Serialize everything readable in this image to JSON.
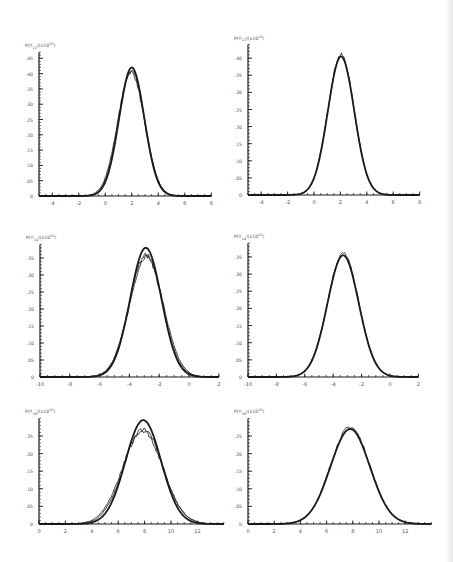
{
  "figure": {
    "layout": "3 rows x 2 columns",
    "line_color": "#1a1a1a",
    "text_color": "#555555"
  },
  "chart_data": [
    {
      "id": "p1",
      "type": "line",
      "position": "row1-left",
      "ylabel": "P(Y12)(x10)",
      "xticks": [
        -4,
        -2,
        0,
        2,
        4,
        6,
        8
      ],
      "yticks": [
        0,
        0.05,
        0.1,
        0.15,
        0.2,
        0.25,
        0.3,
        0.35,
        0.4,
        0.45
      ],
      "ytick_labels": [
        "0",
        ".05",
        ".10",
        ".15",
        ".20",
        ".25",
        ".30",
        ".35",
        ".40",
        ".45"
      ],
      "xlim": [
        -5,
        8
      ],
      "ylim": [
        0,
        0.47
      ],
      "series": [
        {
          "name": "theory",
          "style": "solid-thick",
          "mean": 2.0,
          "sigma": 0.95,
          "peak": 0.42
        },
        {
          "name": "simulation-a",
          "style": "noisy",
          "mean": 2.0,
          "sigma": 0.98,
          "peak": 0.41
        },
        {
          "name": "simulation-b",
          "style": "noisy",
          "mean": 1.95,
          "sigma": 1.0,
          "peak": 0.405
        }
      ]
    },
    {
      "id": "p2",
      "type": "line",
      "position": "row1-right",
      "ylabel": "P(Y12)(x10)",
      "xticks": [
        -4,
        -2,
        0,
        2,
        4,
        6,
        8
      ],
      "yticks": [
        0,
        0.05,
        0.1,
        0.15,
        0.2,
        0.25,
        0.3,
        0.35,
        0.4
      ],
      "ytick_labels": [
        "0",
        ".05",
        ".10",
        ".15",
        ".20",
        ".25",
        ".30",
        ".35",
        ".40"
      ],
      "xlim": [
        -5,
        8
      ],
      "ylim": [
        0,
        0.44
      ],
      "series": [
        {
          "name": "theory",
          "style": "solid-thick",
          "mean": 2.05,
          "sigma": 1.0,
          "peak": 0.405
        },
        {
          "name": "simulation",
          "style": "noisy",
          "mean": 2.05,
          "sigma": 1.0,
          "peak": 0.41
        }
      ]
    },
    {
      "id": "p3",
      "type": "line",
      "position": "row2-left",
      "ylabel": "P(Y14)(x10)",
      "xticks": [
        -10,
        -8,
        -6,
        -4,
        -2,
        0,
        2
      ],
      "yticks": [
        0,
        0.05,
        0.1,
        0.15,
        0.2,
        0.25,
        0.3,
        0.35
      ],
      "ytick_labels": [
        "0",
        ".05",
        ".10",
        ".15",
        ".20",
        ".25",
        ".30",
        ".35"
      ],
      "xlim": [
        -10,
        2
      ],
      "ylim": [
        0,
        0.39
      ],
      "series": [
        {
          "name": "theory",
          "style": "solid-thick",
          "mean": -2.9,
          "sigma": 1.05,
          "peak": 0.38
        },
        {
          "name": "simulation-a",
          "style": "noisy",
          "mean": -2.9,
          "sigma": 1.1,
          "peak": 0.36
        },
        {
          "name": "simulation-b",
          "style": "noisy",
          "mean": -2.85,
          "sigma": 1.12,
          "peak": 0.355
        }
      ]
    },
    {
      "id": "p4",
      "type": "line",
      "position": "row2-right",
      "ylabel": "P(Y14)(x10)",
      "xticks": [
        -10,
        -8,
        -6,
        -4,
        -2,
        0,
        2
      ],
      "yticks": [
        0,
        0.05,
        0.1,
        0.15,
        0.2,
        0.25,
        0.3,
        0.35
      ],
      "ytick_labels": [
        "0",
        ".05",
        ".10",
        ".15",
        ".20",
        ".25",
        ".30",
        ".35"
      ],
      "xlim": [
        -10,
        2
      ],
      "ylim": [
        0,
        0.39
      ],
      "series": [
        {
          "name": "theory",
          "style": "solid-thick",
          "mean": -3.3,
          "sigma": 1.1,
          "peak": 0.355
        },
        {
          "name": "simulation",
          "style": "noisy",
          "mean": -3.3,
          "sigma": 1.1,
          "peak": 0.36
        }
      ]
    },
    {
      "id": "p5",
      "type": "line",
      "position": "row3-left",
      "ylabel": "P(Y16)(x10)",
      "xticks": [
        0,
        2,
        4,
        6,
        8,
        10,
        12
      ],
      "yticks": [
        0,
        0.05,
        0.1,
        0.15,
        0.2,
        0.25
      ],
      "ytick_labels": [
        "0",
        ".05",
        ".10",
        ".15",
        ".20",
        ".25"
      ],
      "xlim": [
        0,
        14
      ],
      "ylim": [
        0,
        0.3
      ],
      "series": [
        {
          "name": "theory",
          "style": "solid-thick",
          "mean": 7.9,
          "sigma": 1.35,
          "peak": 0.295
        },
        {
          "name": "simulation-a",
          "style": "noisy",
          "mean": 7.9,
          "sigma": 1.48,
          "peak": 0.27
        },
        {
          "name": "simulation-b",
          "style": "noisy",
          "mean": 7.85,
          "sigma": 1.52,
          "peak": 0.265
        }
      ]
    },
    {
      "id": "p6",
      "type": "line",
      "position": "row3-right",
      "ylabel": "P(Y16)(x10)",
      "xticks": [
        0,
        2,
        4,
        6,
        8,
        10,
        12
      ],
      "yticks": [
        0,
        0.05,
        0.1,
        0.15,
        0.2,
        0.25
      ],
      "ytick_labels": [
        "0",
        ".05",
        ".10",
        ".15",
        ".20",
        ".25"
      ],
      "xlim": [
        0,
        14
      ],
      "ylim": [
        0,
        0.3
      ],
      "series": [
        {
          "name": "theory",
          "style": "solid-thick",
          "mean": 7.8,
          "sigma": 1.5,
          "peak": 0.27
        },
        {
          "name": "simulation",
          "style": "noisy",
          "mean": 7.8,
          "sigma": 1.5,
          "peak": 0.275
        }
      ]
    }
  ],
  "panel_geometry": {
    "p1": {
      "ox": 39,
      "oy": 196,
      "x0": -5,
      "xs": 13.25,
      "ys": 306
    },
    "p2": {
      "ox": 248,
      "oy": 195,
      "x0": -5,
      "xs": 13.2,
      "ys": 342
    },
    "p3": {
      "ox": 40,
      "oy": 377,
      "x0": -10,
      "xs": 14.9,
      "ys": 340
    },
    "p4": {
      "ox": 248,
      "oy": 377,
      "x0": -10,
      "xs": 14.2,
      "ys": 343
    },
    "p5": {
      "ox": 39,
      "oy": 524,
      "x0": 0,
      "xs": 13.2,
      "ys": 352
    },
    "p6": {
      "ox": 248,
      "oy": 524,
      "x0": 0,
      "xs": 13.1,
      "ys": 352
    }
  }
}
